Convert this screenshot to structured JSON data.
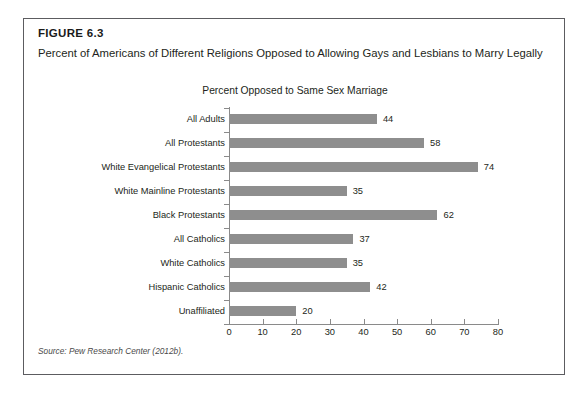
{
  "figure": {
    "number": "FIGURE 6.3",
    "title": "Percent of Americans of Different Religions Opposed to Allowing Gays and Lesbians to Marry Legally",
    "source": "Source: Pew Research Center (2012b)."
  },
  "colors": {
    "bar": "#8e8e8e",
    "axis": "#8a8a8a",
    "border": "#5c5c60",
    "text": "#231f20"
  },
  "chart_data": {
    "type": "bar",
    "orientation": "horizontal",
    "title": "Percent Opposed to Same Sex Marriage",
    "xlabel": "",
    "ylabel": "",
    "xlim": [
      0,
      80
    ],
    "xticks": [
      0,
      10,
      20,
      30,
      40,
      50,
      60,
      70,
      80
    ],
    "grid": false,
    "legend": null,
    "categories": [
      "All Adults",
      "All Protestants",
      "White Evangelical Protestants",
      "White Mainline Protestants",
      "Black Protestants",
      "All Catholics",
      "White Catholics",
      "Hispanic Catholics",
      "Unaffiliated"
    ],
    "values": [
      44,
      58,
      74,
      35,
      62,
      37,
      35,
      42,
      20
    ],
    "value_labels": [
      "44",
      "58",
      "74",
      "35",
      "62",
      "37",
      "35",
      "42",
      "20"
    ]
  }
}
